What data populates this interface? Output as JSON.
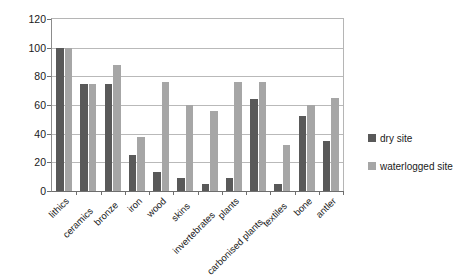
{
  "chart_data": {
    "type": "bar",
    "title": "",
    "subtitle": "",
    "xlabel": "",
    "ylabel": "% surviving",
    "ylim": [
      0,
      120
    ],
    "ytick_step": 20,
    "yticks": [
      0,
      20,
      40,
      60,
      80,
      100,
      120
    ],
    "grid": "horizontal",
    "legend_position": "right",
    "categories": [
      "lithics",
      "ceramics",
      "bronze",
      "iron",
      "wood",
      "skins",
      "invertebrates",
      "plants",
      "carbonised plants",
      "textiles",
      "bone",
      "antler"
    ],
    "series": [
      {
        "name": "dry site",
        "color": "#595959",
        "values": [
          100,
          75,
          75,
          25,
          13,
          9,
          5,
          9,
          64,
          5,
          52,
          35
        ]
      },
      {
        "name": "waterlogged site",
        "color": "#a6a6a6",
        "values": [
          100,
          75,
          88,
          38,
          76,
          60,
          56,
          76,
          76,
          32,
          60,
          65
        ]
      }
    ]
  },
  "legend": {
    "items": [
      {
        "label": "dry site",
        "key": "dry"
      },
      {
        "label": "waterlogged site",
        "key": "wet"
      }
    ]
  },
  "colors": {
    "dry_site": "#595959",
    "waterlogged_site": "#a6a6a6",
    "gridline": "#b9b9b9",
    "axis": "#6e6e6e",
    "background": "#ffffff",
    "text": "#1a1a1a"
  }
}
